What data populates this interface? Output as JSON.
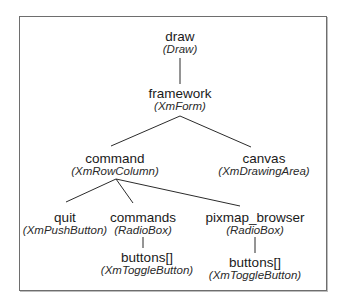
{
  "diagram": {
    "type": "widget-tree",
    "nodes": [
      {
        "id": "draw",
        "name": "draw",
        "class": "(Draw)"
      },
      {
        "id": "framework",
        "name": "framework",
        "class": "(XmForm)"
      },
      {
        "id": "command",
        "name": "command",
        "class": "(XmRowColumn)"
      },
      {
        "id": "canvas",
        "name": "canvas",
        "class": "(XmDrawingArea)"
      },
      {
        "id": "quit",
        "name": "quit",
        "class": "(XmPushButton)"
      },
      {
        "id": "commands",
        "name": "commands",
        "class": "(RadioBox)"
      },
      {
        "id": "pixmap_browser",
        "name": "pixmap_browser",
        "class": "(RadioBox)"
      },
      {
        "id": "commands_buttons",
        "name": "buttons[]",
        "class": "(XmToggleButton)"
      },
      {
        "id": "pixmap_buttons",
        "name": "buttons[]",
        "class": "(XmToggleButton)"
      }
    ],
    "edges": [
      [
        "draw",
        "framework"
      ],
      [
        "framework",
        "command"
      ],
      [
        "framework",
        "canvas"
      ],
      [
        "command",
        "quit"
      ],
      [
        "command",
        "commands"
      ],
      [
        "command",
        "pixmap_browser"
      ],
      [
        "commands",
        "commands_buttons"
      ],
      [
        "pixmap_browser",
        "pixmap_buttons"
      ]
    ]
  }
}
